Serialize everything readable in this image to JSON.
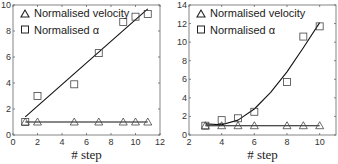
{
  "chart_data": [
    {
      "type": "scatter",
      "title": "",
      "xlabel": "# step",
      "ylabel": "",
      "xlim": [
        0,
        12
      ],
      "ylim": [
        0,
        10
      ],
      "xticks": [
        0,
        2,
        4,
        6,
        8,
        10,
        12
      ],
      "yticks": [
        0,
        2,
        4,
        6,
        8,
        10
      ],
      "grid": false,
      "legend_position": "upper left",
      "series": [
        {
          "name": "Normalised velocity",
          "marker": "triangle",
          "x": [
            1,
            2,
            5,
            7,
            9,
            10,
            11
          ],
          "values": [
            1,
            1,
            1,
            1,
            1,
            1,
            1
          ],
          "fit": "linear",
          "fit_line": [
            [
              1,
              1.0
            ],
            [
              11,
              1.0
            ]
          ]
        },
        {
          "name": "Normalised α",
          "marker": "square",
          "x": [
            1,
            2,
            5,
            7,
            9,
            10,
            11
          ],
          "values": [
            1,
            3,
            3.9,
            6.3,
            8.7,
            9.1,
            9.3
          ],
          "fit": "linear",
          "fit_line": [
            [
              1,
              1.4
            ],
            [
              11,
              9.7
            ]
          ]
        }
      ]
    },
    {
      "type": "scatter",
      "title": "",
      "xlabel": "# step",
      "ylabel": "",
      "xlim": [
        2,
        11
      ],
      "ylim": [
        0,
        14
      ],
      "xticks": [
        2,
        4,
        6,
        8,
        10
      ],
      "yticks": [
        0,
        2,
        4,
        6,
        8,
        10,
        12,
        14
      ],
      "grid": false,
      "legend_position": "upper left",
      "series": [
        {
          "name": "Normalised velocity",
          "marker": "triangle",
          "x": [
            3,
            4,
            5,
            6,
            8,
            9,
            10
          ],
          "values": [
            1,
            1,
            1,
            1,
            1,
            1,
            1
          ],
          "fit": "linear",
          "fit_line": [
            [
              3,
              1.0
            ],
            [
              10,
              1.0
            ]
          ]
        },
        {
          "name": "Normalised α",
          "marker": "square",
          "x": [
            3,
            4,
            5,
            6,
            8,
            9,
            10
          ],
          "values": [
            1,
            1.6,
            1.8,
            2.5,
            5.7,
            10.6,
            11.7
          ],
          "fit": "polynomial",
          "fit_line": [
            [
              3,
              1.2
            ],
            [
              4,
              1.1
            ],
            [
              5,
              1.6
            ],
            [
              6,
              2.8
            ],
            [
              7,
              4.6
            ],
            [
              8,
              6.8
            ],
            [
              9,
              9.4
            ],
            [
              10,
              12.1
            ]
          ]
        }
      ]
    }
  ]
}
